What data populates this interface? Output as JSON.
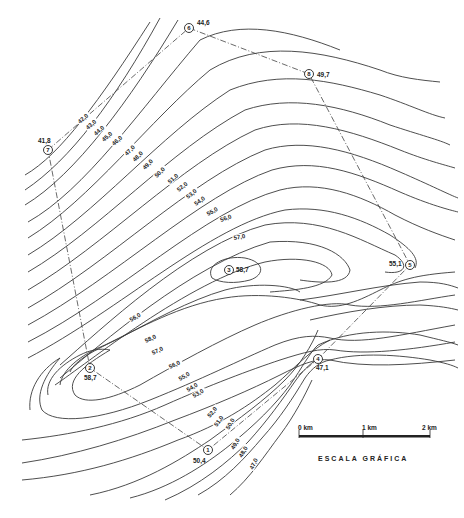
{
  "map": {
    "type": "topographic-contour-map",
    "points": [
      {
        "id": "1",
        "x": 208,
        "y": 450,
        "elev": "50,4",
        "lx": 193,
        "ly": 463
      },
      {
        "id": "2",
        "x": 90,
        "y": 368,
        "elev": "58,7",
        "lx": 84,
        "ly": 380
      },
      {
        "id": "3",
        "x": 229,
        "y": 270,
        "elev": "58,7",
        "lx": 236,
        "ly": 272
      },
      {
        "id": "4",
        "x": 318,
        "y": 359,
        "elev": "47,1",
        "lx": 316,
        "ly": 370
      },
      {
        "id": "5",
        "x": 410,
        "y": 265,
        "elev": "55,1",
        "lx": 389,
        "ly": 266
      },
      {
        "id": "6",
        "x": 189,
        "y": 28,
        "elev": "44,6",
        "lx": 197,
        "ly": 25
      },
      {
        "id": "7",
        "x": 48,
        "y": 150,
        "elev": "41,8",
        "lx": 38,
        "ly": 143
      },
      {
        "id": "8",
        "x": 309,
        "y": 74,
        "elev": "49,7",
        "lx": 317,
        "ly": 77
      }
    ],
    "contour_labels": [
      {
        "text": "42,0",
        "x": 80,
        "y": 124,
        "r": -42
      },
      {
        "text": "43,0",
        "x": 88,
        "y": 130,
        "r": -42
      },
      {
        "text": "44,0",
        "x": 96,
        "y": 136,
        "r": -42
      },
      {
        "text": "45,0",
        "x": 104,
        "y": 142,
        "r": -42
      },
      {
        "text": "46,0",
        "x": 114,
        "y": 146,
        "r": -42
      },
      {
        "text": "47,0",
        "x": 127,
        "y": 156,
        "r": -45
      },
      {
        "text": "48,0",
        "x": 135,
        "y": 162,
        "r": -45
      },
      {
        "text": "49,0",
        "x": 145,
        "y": 170,
        "r": -45
      },
      {
        "text": "50,0",
        "x": 157,
        "y": 178,
        "r": -45
      },
      {
        "text": "51,0",
        "x": 170,
        "y": 184,
        "r": -42
      },
      {
        "text": "52,0",
        "x": 179,
        "y": 192,
        "r": -40
      },
      {
        "text": "53,0",
        "x": 188,
        "y": 199,
        "r": -38
      },
      {
        "text": "54,0",
        "x": 196,
        "y": 206,
        "r": -35
      },
      {
        "text": "55,0",
        "x": 208,
        "y": 216,
        "r": -28
      },
      {
        "text": "56,0",
        "x": 221,
        "y": 222,
        "r": -20
      },
      {
        "text": "57,0",
        "x": 234,
        "y": 240,
        "r": -10
      },
      {
        "text": "56,0",
        "x": 131,
        "y": 322,
        "r": -30
      },
      {
        "text": "58,0",
        "x": 146,
        "y": 343,
        "r": -25
      },
      {
        "text": "57,0",
        "x": 153,
        "y": 355,
        "r": -25
      },
      {
        "text": "56,0",
        "x": 170,
        "y": 369,
        "r": -25
      },
      {
        "text": "55,0",
        "x": 180,
        "y": 381,
        "r": -30
      },
      {
        "text": "54,0",
        "x": 188,
        "y": 392,
        "r": -30
      },
      {
        "text": "53,0",
        "x": 194,
        "y": 398,
        "r": -30
      },
      {
        "text": "52,0",
        "x": 210,
        "y": 418,
        "r": -50
      },
      {
        "text": "51,0",
        "x": 217,
        "y": 427,
        "r": -55
      },
      {
        "text": "50,0",
        "x": 229,
        "y": 430,
        "r": -60
      },
      {
        "text": "49,0",
        "x": 234,
        "y": 450,
        "r": -60
      },
      {
        "text": "48,0",
        "x": 242,
        "y": 458,
        "r": -60
      },
      {
        "text": "47,0",
        "x": 253,
        "y": 470,
        "r": -65
      }
    ]
  },
  "scale_bar": {
    "labels": [
      "0 km",
      "1 km",
      "2 km"
    ],
    "title": "ESCALA GRÁFICA"
  }
}
